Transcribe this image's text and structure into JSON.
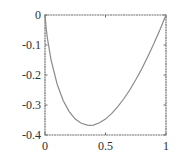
{
  "chart_data": {
    "type": "line",
    "title": "",
    "xlabel": "",
    "ylabel": "",
    "function_hint": "y = x*ln(x)",
    "xlim": [
      0,
      1
    ],
    "ylim": [
      -0.4,
      0
    ],
    "grid": false,
    "legend": null,
    "x_ticks": [
      {
        "value": 0,
        "label": "0"
      },
      {
        "value": 0.5,
        "label": "0.5"
      },
      {
        "value": 1,
        "label": "1"
      }
    ],
    "y_ticks": [
      {
        "value": 0,
        "label": "0"
      },
      {
        "value": -0.1,
        "label": "-0.1"
      },
      {
        "value": -0.2,
        "label": "-0.2"
      },
      {
        "value": -0.3,
        "label": "-0.3"
      },
      {
        "value": -0.4,
        "label": "-0.4"
      }
    ],
    "series": [
      {
        "name": "curve",
        "color": "#8a8a8a",
        "x": [
          0,
          0.01,
          0.02,
          0.05,
          0.1,
          0.15,
          0.2,
          0.25,
          0.3,
          0.35,
          0.368,
          0.4,
          0.45,
          0.5,
          0.55,
          0.6,
          0.65,
          0.7,
          0.75,
          0.8,
          0.85,
          0.9,
          0.95,
          1.0
        ],
        "y": [
          0,
          -0.046,
          -0.078,
          -0.15,
          -0.23,
          -0.285,
          -0.322,
          -0.347,
          -0.361,
          -0.367,
          -0.368,
          -0.367,
          -0.359,
          -0.347,
          -0.329,
          -0.306,
          -0.28,
          -0.25,
          -0.216,
          -0.179,
          -0.138,
          -0.095,
          -0.049,
          0
        ]
      }
    ],
    "minimum": {
      "x": 0.368,
      "y": -0.368
    }
  },
  "style": {
    "axis_color": "#6e6e6e",
    "text_color": "#2e2e2e",
    "background": "#ffffff"
  }
}
